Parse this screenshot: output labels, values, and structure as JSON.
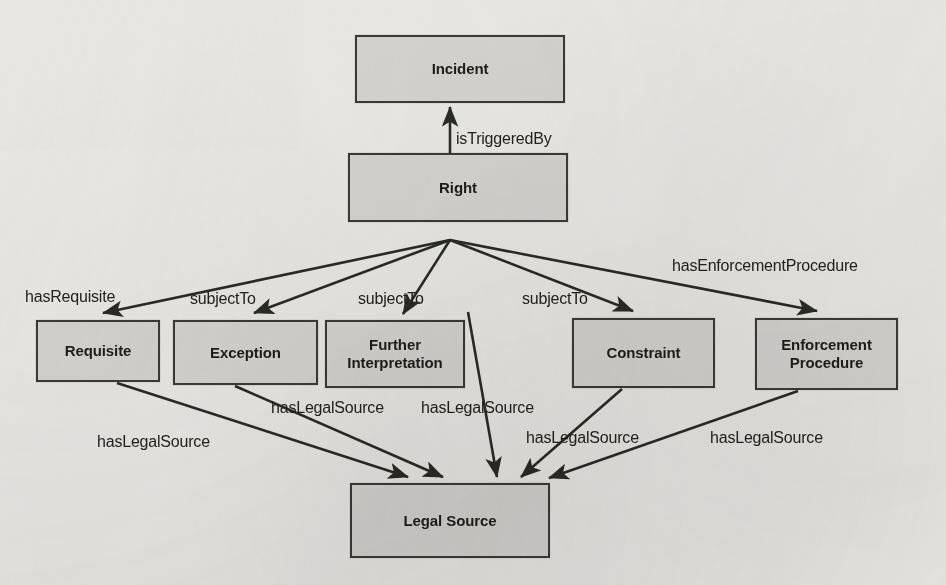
{
  "diagram": {
    "background_color": "#e9e7e4",
    "node_fill_color": "#d4d2cf",
    "node_border_color": "#3a3a38",
    "text_color": "#1d1d1b",
    "nodes": [
      {
        "id": "incident",
        "label": "Incident",
        "x": 355,
        "y": 35,
        "w": 210,
        "h": 68
      },
      {
        "id": "right",
        "label": "Right",
        "x": 348,
        "y": 153,
        "w": 220,
        "h": 69
      },
      {
        "id": "requisite",
        "label": "Requisite",
        "x": 36,
        "y": 320,
        "w": 124,
        "h": 62
      },
      {
        "id": "exception",
        "label": "Exception",
        "x": 173,
        "y": 320,
        "w": 145,
        "h": 65
      },
      {
        "id": "further-interpretation",
        "label": "Further\nInterpretation",
        "x": 325,
        "y": 320,
        "w": 140,
        "h": 68
      },
      {
        "id": "constraint",
        "label": "Constraint",
        "x": 572,
        "y": 318,
        "w": 143,
        "h": 70
      },
      {
        "id": "enforcement-procedure",
        "label": "Enforcement\nProcedure",
        "x": 755,
        "y": 318,
        "w": 143,
        "h": 72
      },
      {
        "id": "legal-source",
        "label": "Legal Source",
        "x": 350,
        "y": 483,
        "w": 200,
        "h": 75
      }
    ],
    "edges": [
      {
        "id": "right-istriggeredby-incident",
        "from": "right",
        "to": "incident",
        "label": "isTriggeredBy",
        "label_x": 456,
        "label_y": 131
      },
      {
        "id": "right-hasrequisite-requisite",
        "from": "right",
        "to": "requisite",
        "label": "hasRequisite",
        "label_x": 25,
        "label_y": 289
      },
      {
        "id": "right-subjectto-exception",
        "from": "right",
        "to": "exception",
        "label": "subjectTo",
        "label_x": 190,
        "label_y": 291
      },
      {
        "id": "right-subjectto-furtherinterp",
        "from": "right",
        "to": "further-interpretation",
        "label": "subjectTo",
        "label_x": 358,
        "label_y": 291
      },
      {
        "id": "right-subjectto-constraint",
        "from": "right",
        "to": "constraint",
        "label": "subjectTo",
        "label_x": 522,
        "label_y": 291
      },
      {
        "id": "right-hasenforcementprocedure-ep",
        "from": "right",
        "to": "enforcement-procedure",
        "label": "hasEnforcementProcedure",
        "label_x": 672,
        "label_y": 258
      },
      {
        "id": "requisite-haslegalsource",
        "from": "requisite",
        "to": "legal-source",
        "label": "hasLegalSource",
        "label_x": 97,
        "label_y": 434
      },
      {
        "id": "exception-haslegalsource",
        "from": "exception",
        "to": "legal-source",
        "label": "hasLegalSource",
        "label_x": 271,
        "label_y": 400
      },
      {
        "id": "furtherinterp-haslegalsource",
        "from": "further-interpretation",
        "to": "legal-source",
        "label": "hasLegalSource",
        "label_x": 421,
        "label_y": 400
      },
      {
        "id": "constraint-haslegalsource",
        "from": "constraint",
        "to": "legal-source",
        "label": "hasLegalSource",
        "label_x": 526,
        "label_y": 430
      },
      {
        "id": "enforcementprocedure-haslegalsource",
        "from": "enforcement-procedure",
        "to": "legal-source",
        "label": "hasLegalSource",
        "label_x": 710,
        "label_y": 430
      }
    ]
  }
}
